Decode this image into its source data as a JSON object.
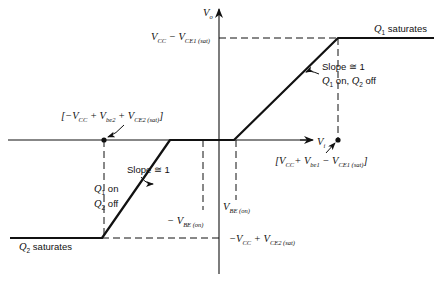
{
  "diagram": {
    "type": "voltage-transfer-characteristic",
    "axes": {
      "x_label": "V",
      "x_sub": "i",
      "y_label": "V",
      "y_sub": "o"
    },
    "labels": {
      "top_level": {
        "main": "V",
        "main_sub": "CC",
        "minus": " − V",
        "minus_sub": "CE1 (sat)"
      },
      "bottom_level": {
        "prefix": "−V",
        "prefix_sub": "CC",
        "plus": " + V",
        "plus_sub": "CE2 (sat)"
      },
      "q1_saturates": {
        "q": "Q",
        "q_sub": "1",
        "text": " saturates"
      },
      "q2_saturates": {
        "q": "Q",
        "q_sub": "2",
        "text": " saturates"
      },
      "upper_slope": "Slope ≅ 1",
      "upper_state": {
        "q1": "Q",
        "q1_sub": "1",
        "mid": "  on,  ",
        "q2": "Q",
        "q2_sub": "2",
        "end": "  off"
      },
      "lower_slope": "Slope ≅ 1",
      "lower_state_line1": {
        "q": "Q",
        "q_sub": "1",
        "text": " on"
      },
      "lower_state_line2": {
        "q": "Q",
        "q_sub": "2",
        "text": " off"
      },
      "neg_vbe": {
        "text": "− V",
        "sub": "BE (on)"
      },
      "pos_vbe": {
        "text": "V",
        "sub": "BE (on)"
      },
      "neg_breakpoint": {
        "open": "[−V",
        "s1": "CC",
        "p1": " + V",
        "s2": "be2",
        "p2": " + V",
        "s3": "CE2 (sat)",
        "close": "]"
      },
      "pos_breakpoint": {
        "open": "[V",
        "s1": "CC",
        "p1": "+ V",
        "s2": "be1",
        "p2": " − V",
        "s3": "CE1 (sat)",
        "close": "]"
      }
    }
  }
}
